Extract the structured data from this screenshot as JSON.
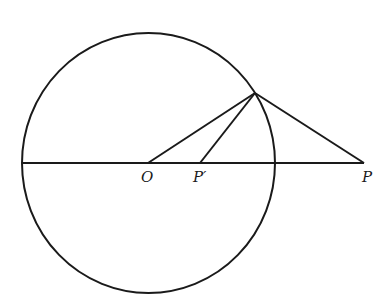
{
  "figure": {
    "stroke_color": "#1a1a1a",
    "background": "#ffffff"
  },
  "labels": {
    "O": "O",
    "P_prime": "P′",
    "P": "P"
  }
}
